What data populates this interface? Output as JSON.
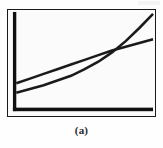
{
  "figure": {
    "caption": "(a)",
    "panel_label": "a"
  },
  "colors": {
    "ink": "#1a1a1a",
    "axis": "#111111",
    "plot_background": "#fbfbfb",
    "page_background": "#ffffff",
    "curve_straight": "#1a1a1a",
    "curve_convex": "#1a1a1a"
  },
  "chart_data": {
    "type": "line",
    "title": "",
    "subtitle": "",
    "xlabel": "",
    "ylabel": "",
    "xlim": [
      0,
      100
    ],
    "ylim": [
      0,
      100
    ],
    "grid": false,
    "legend": false,
    "legend_position": "none",
    "axis_ticks": {
      "x": [],
      "y": []
    },
    "annotations": [],
    "x": [
      0,
      10,
      20,
      30,
      40,
      50,
      60,
      70,
      80,
      90,
      100
    ],
    "series": [
      {
        "name": "linear",
        "shape": "near-straight rising line",
        "values": [
          26,
          31,
          36,
          41,
          46,
          51,
          56,
          61,
          65,
          69,
          73
        ]
      },
      {
        "name": "convex",
        "shape": "convex upward curving line",
        "values": [
          16,
          20,
          24,
          29,
          34,
          41,
          49,
          59,
          71,
          85,
          100
        ]
      }
    ],
    "intersection": {
      "x": 71,
      "y": 61
    }
  }
}
